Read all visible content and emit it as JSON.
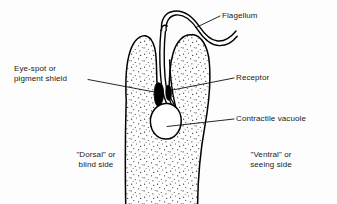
{
  "figure": {
    "background_color": "#fdfdfd",
    "ink_color": "#000000",
    "labels": {
      "flagellum": "Flagellum",
      "eyespot_line1": "Eye-spot or",
      "eyespot_line2": "pigment shield",
      "receptor": "Receptor",
      "vacuole": "Contractile vacuole",
      "dorsal_line1": "\"Dorsal\" or",
      "dorsal_line2": "blind side",
      "ventral_line1": "\"Ventral\" or",
      "ventral_line2": "seeing side"
    },
    "structures": [
      {
        "name": "flagellum",
        "fill": "none"
      },
      {
        "name": "cell-body",
        "fill": "stippled"
      },
      {
        "name": "reservoir-gullet",
        "fill": "none"
      },
      {
        "name": "eye-spot",
        "fill": "#000000"
      },
      {
        "name": "receptor",
        "fill": "#000000"
      },
      {
        "name": "contractile-vacuole",
        "fill": "none"
      }
    ]
  }
}
